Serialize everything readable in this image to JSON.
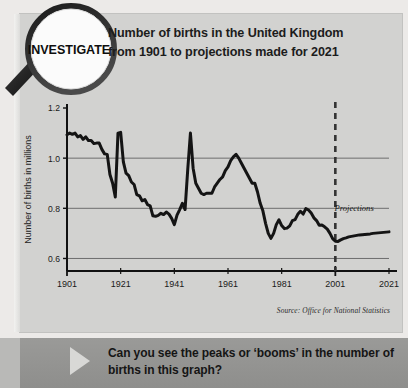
{
  "badge": {
    "label": "INVESTIGATE",
    "icon": "magnifier-icon"
  },
  "header": {
    "line1": "Number of births in the United Kingdom",
    "line2": "from 1901 to projections made for 2021"
  },
  "source": "Source: Office for National Statistics",
  "footer": {
    "line1": "Can you see the peaks or ‘booms’ in the number of",
    "line2": "births in this graph?"
  },
  "chart_data": {
    "type": "line",
    "title": "Number of births in the United Kingdom from 1901 to projections made for 2021",
    "xlabel": "",
    "ylabel": "Number of births in millions",
    "xlim": [
      1901,
      2021
    ],
    "ylim": [
      0.55,
      1.2
    ],
    "xticks": [
      "1901",
      "1921",
      "1941",
      "1961",
      "1981",
      "2001",
      "2021"
    ],
    "yticks": [
      "1.2",
      "1.0",
      "0.8",
      "0.6"
    ],
    "ytick_values": [
      1.2,
      1.0,
      0.8,
      0.6
    ],
    "gridlines": [
      1.0,
      0.8,
      0.6
    ],
    "grid": true,
    "legend": "none",
    "annotations": [
      {
        "text": "Projections",
        "x": 2008,
        "y": 0.79,
        "name": "projections-label"
      }
    ],
    "markers": [
      {
        "type": "vline",
        "x": 2001,
        "style": "dashed",
        "name": "projection-divider"
      }
    ],
    "line_color": "#141414",
    "series": [
      {
        "name": "Births (millions)",
        "x": [
          1901,
          1902,
          1903,
          1904,
          1905,
          1906,
          1907,
          1908,
          1909,
          1910,
          1911,
          1912,
          1913,
          1914,
          1915,
          1916,
          1917,
          1918,
          1919,
          1920,
          1921,
          1922,
          1923,
          1924,
          1925,
          1926,
          1927,
          1928,
          1929,
          1930,
          1931,
          1932,
          1933,
          1934,
          1935,
          1936,
          1937,
          1938,
          1939,
          1940,
          1941,
          1942,
          1943,
          1944,
          1945,
          1946,
          1947,
          1948,
          1949,
          1950,
          1951,
          1952,
          1953,
          1954,
          1955,
          1956,
          1957,
          1958,
          1959,
          1960,
          1961,
          1962,
          1963,
          1964,
          1965,
          1966,
          1967,
          1968,
          1969,
          1970,
          1971,
          1972,
          1973,
          1974,
          1975,
          1976,
          1977,
          1978,
          1979,
          1980,
          1981,
          1982,
          1983,
          1984,
          1985,
          1986,
          1987,
          1988,
          1989,
          1990,
          1991,
          1992,
          1993,
          1994,
          1995,
          1996,
          1997,
          1998,
          1999,
          2000,
          2001,
          2002,
          2003,
          2004,
          2005,
          2006,
          2007,
          2008,
          2009,
          2010,
          2011,
          2012,
          2013,
          2014,
          2015,
          2016,
          2017,
          2018,
          2019,
          2020,
          2021
        ],
        "values": [
          1.093,
          1.1,
          1.095,
          1.1,
          1.085,
          1.09,
          1.075,
          1.085,
          1.07,
          1.07,
          1.058,
          1.06,
          1.06,
          1.035,
          1.017,
          1.015,
          0.935,
          0.9,
          0.845,
          1.1,
          1.103,
          0.985,
          0.94,
          0.93,
          0.905,
          0.895,
          0.855,
          0.85,
          0.83,
          0.835,
          0.815,
          0.81,
          0.77,
          0.768,
          0.772,
          0.78,
          0.775,
          0.785,
          0.777,
          0.76,
          0.735,
          0.773,
          0.795,
          0.82,
          0.795,
          0.955,
          1.1,
          0.96,
          0.9,
          0.88,
          0.86,
          0.855,
          0.86,
          0.86,
          0.86,
          0.885,
          0.9,
          0.915,
          0.925,
          0.95,
          0.965,
          0.99,
          1.005,
          1.015,
          1.0,
          0.98,
          0.96,
          0.94,
          0.92,
          0.9,
          0.9,
          0.865,
          0.82,
          0.79,
          0.74,
          0.7,
          0.68,
          0.7,
          0.735,
          0.754,
          0.731,
          0.719,
          0.721,
          0.73,
          0.751,
          0.755,
          0.776,
          0.788,
          0.777,
          0.799,
          0.793,
          0.781,
          0.762,
          0.751,
          0.732,
          0.733,
          0.726,
          0.717,
          0.7,
          0.679,
          0.669,
          0.668,
          0.674,
          0.679,
          0.682,
          0.686,
          0.688,
          0.69,
          0.692,
          0.694,
          0.695,
          0.696,
          0.697,
          0.698,
          0.7,
          0.701,
          0.702,
          0.703,
          0.704,
          0.705,
          0.706
        ],
        "projection_from": 2001
      }
    ]
  }
}
